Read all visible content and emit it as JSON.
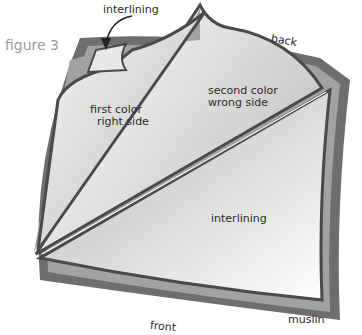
{
  "figure_label": "figure 3",
  "labels": {
    "interlining_top": "interlining",
    "back": "back",
    "first_color_line1": "first color",
    "first_color_line2": "right side",
    "second_color_line1": "second color",
    "second_color_line2": "wrong side",
    "interlining_center": "interlining",
    "muslin": "muslin",
    "front": "front"
  },
  "colors": {
    "muslin_border": "#6e6e6e",
    "inner_band": "#9c9c9c",
    "outline": "#4a4a4a",
    "fabric_light": "#f2f2f2",
    "fabric_shade": "#bdbdbd"
  }
}
